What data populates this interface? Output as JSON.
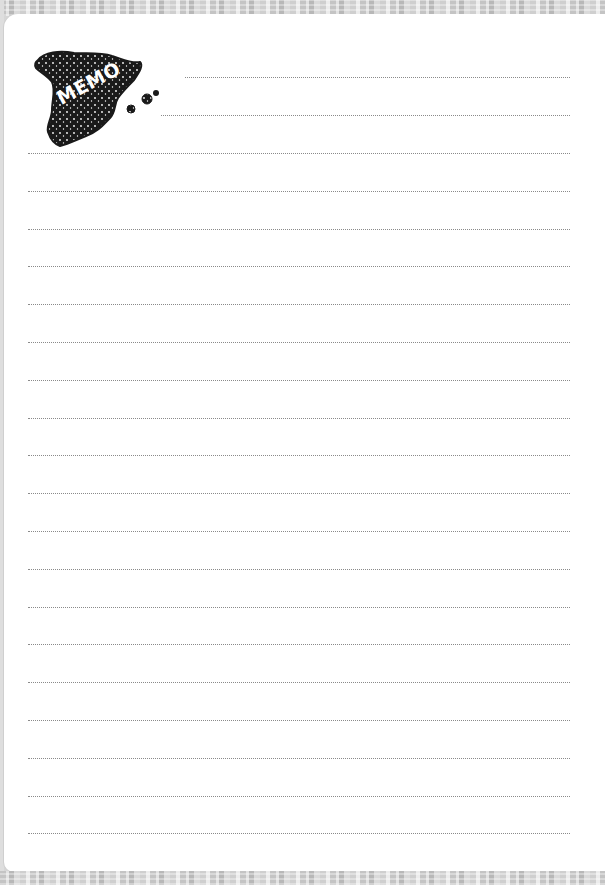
{
  "memo": {
    "logo": {
      "label": "MEMO",
      "shape": "spain-map-silhouette",
      "fill_color": "#1a1a1a",
      "text_color": "#ffffff"
    },
    "colors": {
      "paper": "#ffffff",
      "line": "#8a8a8a",
      "frame": "#d0d0d0"
    },
    "lines": {
      "short": [
        {
          "top": 63,
          "left": 181,
          "width": 385
        },
        {
          "top": 101,
          "left": 157,
          "width": 409
        }
      ],
      "full_count": 19,
      "full_first_top": 139,
      "full_spacing": 37.8,
      "full_left": 24,
      "full_width": 542
    }
  }
}
